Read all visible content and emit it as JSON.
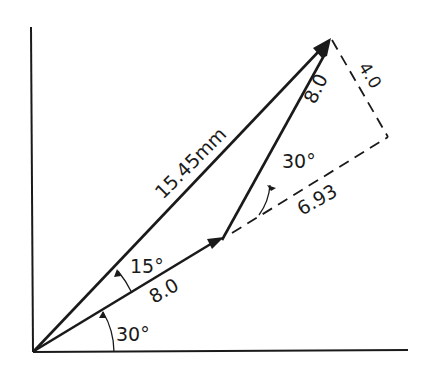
{
  "diagram": {
    "colors": {
      "ink": "#1a1a1a",
      "background": "#ffffff"
    },
    "labels": {
      "resultant": "15.45mm",
      "vector1_magnitude": "8.0",
      "vector2_magnitude": "8.0",
      "perpendicular_component": "4.0",
      "parallel_component": "6.93",
      "angle_base": "30°",
      "angle_between": "15°",
      "angle_relative": "30°"
    },
    "vectors": [
      {
        "name": "vector-1",
        "magnitude": "8.0",
        "angle_from_x": "30°"
      },
      {
        "name": "vector-2",
        "magnitude": "8.0",
        "angle_from_vector1": "30°"
      },
      {
        "name": "resultant",
        "magnitude": "15.45mm",
        "angle_from_vector1": "15°"
      }
    ],
    "components": [
      {
        "name": "parallel-extension",
        "value": "6.93",
        "style": "dashed"
      },
      {
        "name": "perpendicular",
        "value": "4.0",
        "style": "dashed"
      }
    ]
  }
}
